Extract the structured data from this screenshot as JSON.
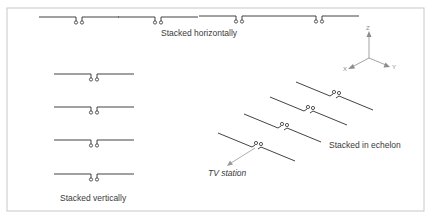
{
  "diagram": {
    "labels": {
      "horizontal": "Stacked horizontally",
      "vertical": "Stacked vertically",
      "echelon": "Stacked in echelon",
      "tv_station": "TV station"
    },
    "axes": {
      "z": "Z",
      "x": "X",
      "y": "Y"
    },
    "colors": {
      "frame": "#c8c8c8",
      "wire": "#2e2e2e",
      "axis": "#8c8c8c",
      "text": "#3a3a3a"
    },
    "counts": {
      "horizontal_dipoles": 4,
      "vertical_dipoles": 4,
      "echelon_dipoles": 4
    }
  }
}
